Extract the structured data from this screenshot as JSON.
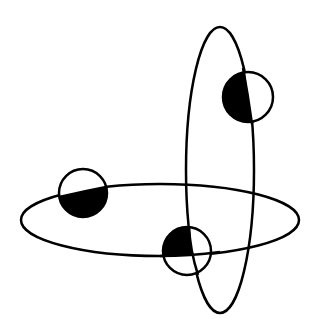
{
  "diagram": {
    "width": 319,
    "height": 333,
    "background": "#ffffff",
    "stroke_color": "#000000",
    "fill_color": "#000000",
    "stroke_width": 2.5,
    "orbits": [
      {
        "id": "horizontal-orbit",
        "cx": 160,
        "cy": 220,
        "rx": 139,
        "ry": 36
      },
      {
        "id": "vertical-orbit",
        "cx": 220,
        "cy": 170,
        "rx": 34,
        "ry": 143
      }
    ],
    "bodies": [
      {
        "id": "body-top-right",
        "cx": 248,
        "cy": 97,
        "r": 25,
        "shaded": "left-half"
      },
      {
        "id": "body-left",
        "cx": 83,
        "cy": 193,
        "r": 24,
        "shaded": "lower-half"
      },
      {
        "id": "body-bottom-center",
        "cx": 187,
        "cy": 251,
        "r": 24,
        "shaded": "upper-left-quadrant"
      }
    ]
  }
}
